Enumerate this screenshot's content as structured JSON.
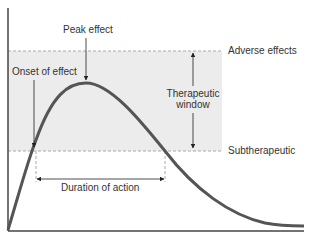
{
  "diagram": {
    "title": "",
    "labels": {
      "peak": "Peak effect",
      "onset": "Onset of effect",
      "adverse": "Adverse effects",
      "window_line1": "Therapeutic",
      "window_line2": "window",
      "subtherapeutic": "Subtherapeutic",
      "duration": "Duration of action"
    },
    "colors": {
      "curve": "#555555",
      "band_fill": "#ececec",
      "dashed": "#aaaaaa",
      "axis": "#444444",
      "text": "#333333"
    },
    "axes": {
      "x": "",
      "y": ""
    }
  }
}
